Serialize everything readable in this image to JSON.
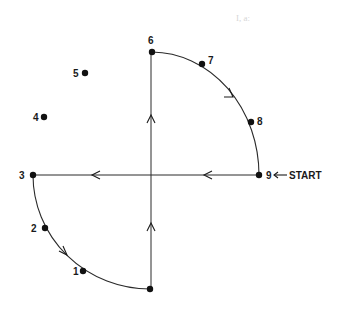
{
  "diagram": {
    "type": "path-sequence",
    "start_label": "START",
    "points": [
      {
        "id": "1",
        "label": "1"
      },
      {
        "id": "2",
        "label": "2"
      },
      {
        "id": "3",
        "label": "3"
      },
      {
        "id": "4",
        "label": "4"
      },
      {
        "id": "5",
        "label": "5"
      },
      {
        "id": "6",
        "label": "6"
      },
      {
        "id": "7",
        "label": "7"
      },
      {
        "id": "8",
        "label": "8"
      },
      {
        "id": "9",
        "label": "9"
      }
    ],
    "bleed_through_text": "I, a:",
    "colors": {
      "ink": "#1a1a1a",
      "background": "#ffffff",
      "ghost": "#d6d6d6"
    }
  }
}
